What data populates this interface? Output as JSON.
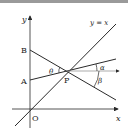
{
  "figure": {
    "labels": {
      "y_axis": "y",
      "x_axis": "x",
      "origin": "O",
      "point_a": "A",
      "point_b": "B",
      "point_p": "P",
      "line_label": "y = x",
      "angle_theta": "θ",
      "angle_alpha": "α",
      "angle_beta": "β"
    },
    "colors": {
      "line": "#2a2a2a",
      "topbar": "#9a9a9a"
    }
  }
}
